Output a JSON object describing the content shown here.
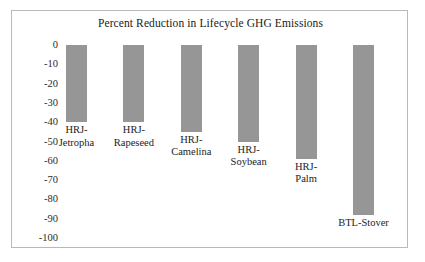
{
  "figure": {
    "title": "Percent Reduction in Lifecycle GHG Emissions",
    "frame_color": "#b9b9b9",
    "bar_color": "#969696",
    "background": "#ffffff"
  },
  "axis": {
    "y_ticks": [
      "0",
      "-10",
      "-20",
      "-30",
      "-40",
      "-50",
      "-60",
      "-70",
      "-80",
      "-90",
      "-100"
    ]
  },
  "bars": [
    {
      "label": "HRJ-\nJetropha",
      "label_line1": "HRJ-",
      "label_line2": "Jetropha",
      "value": -40
    },
    {
      "label": "HRJ-\nRapeseed",
      "label_line1": "HRJ-",
      "label_line2": "Rapeseed",
      "value": -40
    },
    {
      "label": "HRJ-\nCamelina",
      "label_line1": "HRJ-",
      "label_line2": "Camelina",
      "value": -45
    },
    {
      "label": "HRJ-\nSoybean",
      "label_line1": "HRJ-",
      "label_line2": "Soybean",
      "value": -50
    },
    {
      "label": "HRJ-\nPalm",
      "label_line1": "HRJ-",
      "label_line2": "Palm",
      "value": -59
    },
    {
      "label": "BTL-Stover",
      "label_line1": "BTL-Stover",
      "label_line2": "",
      "value": -88
    }
  ],
  "chart_data": {
    "type": "bar",
    "title": "Percent Reduction in Lifecycle GHG Emissions",
    "xlabel": "",
    "ylabel": "",
    "categories": [
      "HRJ-Jetropha",
      "HRJ-Rapeseed",
      "HRJ-Camelina",
      "HRJ-Soybean",
      "HRJ-Palm",
      "BTL-Stover"
    ],
    "values": [
      -40,
      -40,
      -45,
      -50,
      -59,
      -88
    ],
    "ylim": [
      -100,
      0
    ],
    "ytick_labels": [
      "0",
      "-10",
      "-20",
      "-30",
      "-40",
      "-50",
      "-60",
      "-70",
      "-80",
      "-90",
      "-100"
    ],
    "ytick_values": [
      0,
      -10,
      -20,
      -30,
      -40,
      -50,
      -60,
      -70,
      -80,
      -90,
      -100
    ],
    "grid": false,
    "legend": "none",
    "orientation": "vertical",
    "bar_color": "#969696",
    "units": "percent"
  }
}
